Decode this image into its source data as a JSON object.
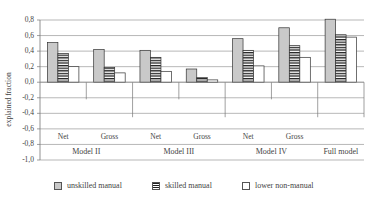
{
  "chart_data": {
    "type": "bar",
    "title": "",
    "xlabel": "",
    "ylabel": "explained fraction",
    "ylim": [
      -1.0,
      0.8
    ],
    "yticks": [
      "0,8",
      "0,6",
      "0,4",
      "0,2",
      "0,0",
      "-0,2",
      "-0,4",
      "-0,6",
      "-0,8",
      "-1,0"
    ],
    "grid": true,
    "legend_position": "bottom",
    "categories": [
      "Net",
      "Gross",
      "Net",
      "Gross",
      "Net",
      "Gross",
      ""
    ],
    "groups": [
      {
        "label": "Model II",
        "span": [
          0,
          1
        ]
      },
      {
        "label": "Model III",
        "span": [
          2,
          3
        ]
      },
      {
        "label": "Model IV",
        "span": [
          4,
          5
        ]
      },
      {
        "label": "Full model",
        "span": [
          6,
          6
        ]
      }
    ],
    "series": [
      {
        "name": "unskilled manual",
        "values": [
          0.51,
          0.42,
          0.41,
          0.17,
          0.56,
          0.7,
          0.81
        ]
      },
      {
        "name": "skilled manual",
        "values": [
          0.37,
          0.19,
          0.32,
          0.06,
          0.41,
          0.47,
          0.61
        ]
      },
      {
        "name": "lower non-manual",
        "values": [
          0.2,
          0.12,
          0.14,
          0.03,
          0.21,
          0.32,
          0.58
        ]
      }
    ]
  },
  "legend": {
    "items": [
      {
        "label": "unskilled manual",
        "pattern": "gray-fill"
      },
      {
        "label": "skilled manual",
        "pattern": "horizontal-stripes"
      },
      {
        "label": "lower non-manual",
        "pattern": "white-fill"
      }
    ]
  },
  "colors": {
    "unskilled": "#c9c9c9",
    "skilled_stripe": "#222222",
    "lower": "#ffffff",
    "grid": "#9a9a9a",
    "text": "#444444"
  }
}
